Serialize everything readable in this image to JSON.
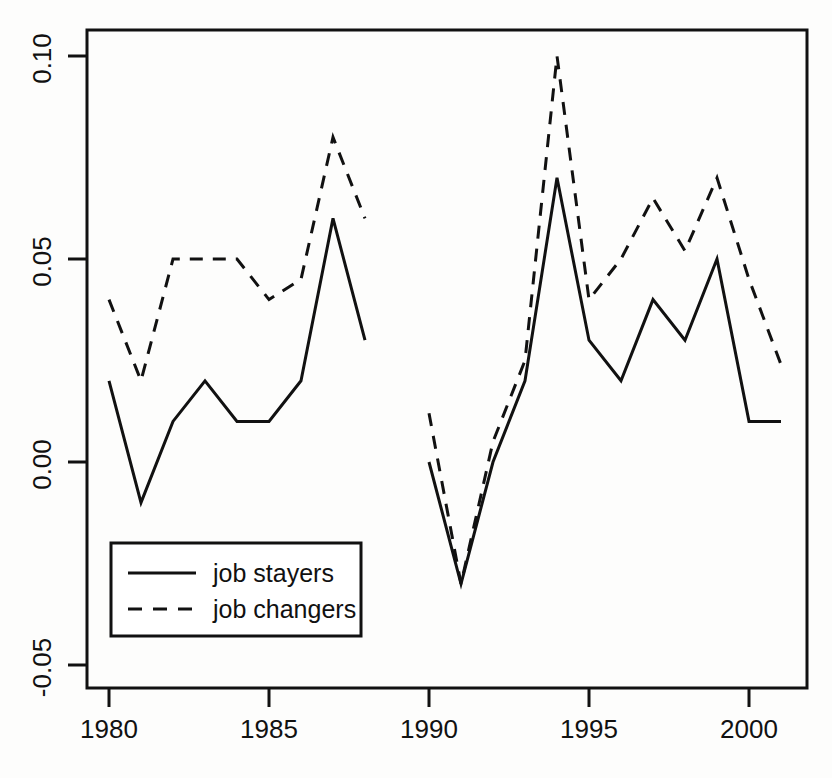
{
  "chart_data": {
    "type": "line",
    "title": "",
    "subtitle": "",
    "xlabel": "",
    "ylabel": "",
    "xlim": [
      1979.0,
      2001.8
    ],
    "ylim": [
      -0.062,
      0.106
    ],
    "xticks": [
      1980,
      1985,
      1990,
      1995,
      2000
    ],
    "xtick_labels": [
      "1980",
      "1985",
      "1990",
      "1995",
      "2000"
    ],
    "yticks": [
      -0.05,
      0.0,
      0.05,
      0.1
    ],
    "ytick_labels": [
      "-0.05",
      "0.00",
      "0.05",
      "0.10"
    ],
    "grid": false,
    "legend_position": "bottom-left",
    "box_border": true,
    "series": [
      {
        "name": "job stayers",
        "style": "solid",
        "color": "#111111",
        "segments": [
          {
            "x": [
              1980,
              1981,
              1982,
              1983,
              1984,
              1985,
              1986,
              1987,
              1988
            ],
            "values": [
              0.02,
              -0.01,
              0.01,
              0.02,
              0.01,
              0.01,
              0.02,
              0.06,
              0.03
            ]
          },
          {
            "x": [
              1990,
              1991,
              1992,
              1993,
              1994,
              1995,
              1996,
              1997,
              1998,
              1999,
              2000,
              2001
            ],
            "values": [
              0.0,
              -0.03,
              0.0,
              0.02,
              0.07,
              0.03,
              0.02,
              0.04,
              0.03,
              0.05,
              0.01,
              0.01
            ]
          }
        ]
      },
      {
        "name": "job changers",
        "style": "dashed",
        "color": "#111111",
        "segments": [
          {
            "x": [
              1980,
              1981,
              1982,
              1983,
              1984,
              1985,
              1986,
              1987,
              1988
            ],
            "values": [
              0.04,
              0.02,
              0.05,
              0.05,
              0.05,
              0.04,
              0.045,
              0.08,
              0.06
            ]
          },
          {
            "x": [
              1990,
              1991,
              1992,
              1993,
              1994,
              1995,
              1996,
              1997,
              1998,
              1999,
              2000,
              2001
            ],
            "values": [
              0.012,
              -0.03,
              0.005,
              0.025,
              0.1,
              0.04,
              0.05,
              0.065,
              0.052,
              0.07,
              0.045,
              0.024
            ]
          }
        ]
      }
    ],
    "legend_entries": [
      {
        "label": "job stayers",
        "style": "solid"
      },
      {
        "label": "job changers",
        "style": "dashed"
      }
    ]
  },
  "axes": {
    "y_tick_0": "-0.05",
    "y_tick_1": "0.00",
    "y_tick_2": "0.05",
    "y_tick_3": "0.10",
    "x_tick_0": "1980",
    "x_tick_1": "1985",
    "x_tick_2": "1990",
    "x_tick_3": "1995",
    "x_tick_4": "2000"
  },
  "legend": {
    "entry_0_label": "job stayers",
    "entry_1_label": "job changers"
  }
}
